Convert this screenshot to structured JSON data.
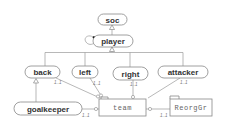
{
  "diagram": {
    "type": "ORM / class hierarchy diagram",
    "nodes": {
      "soc": {
        "label": "soc"
      },
      "player": {
        "label": "player"
      },
      "back": {
        "label": "back"
      },
      "left": {
        "label": "left"
      },
      "right": {
        "label": "right"
      },
      "attacker": {
        "label": "attacker"
      },
      "goalkeeper": {
        "label": "goalkeeper"
      },
      "team": {
        "label": "team"
      },
      "reorggr": {
        "label": "ReorgGr"
      }
    },
    "cardinalities": {
      "back_team": "1..1",
      "left_team": "1..1",
      "right_team": "1..1",
      "attacker_team": "1..1",
      "goalkeeper_team": "1..1",
      "reorggr_team": "1..1"
    },
    "colors": {
      "stroke": "#888888",
      "text": "#333333",
      "background": "#ffffff"
    }
  }
}
